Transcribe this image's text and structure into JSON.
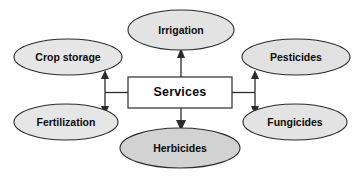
{
  "diagram": {
    "title": "Services",
    "background_color": "#ffffff",
    "center_node": {
      "id": "services",
      "label": "Services",
      "shape": "rectangle",
      "fill": "#ffffff",
      "stroke": "#2b2b2b",
      "x": 128,
      "y": 77,
      "width": 104,
      "height": 31
    },
    "nodes": [
      {
        "id": "crop-storage",
        "label": "Crop storage",
        "shape": "ellipse",
        "fill": "#e6e6e6",
        "stroke": "#2b2b2b",
        "cx": 68,
        "cy": 57,
        "rx": 54,
        "ry": 18
      },
      {
        "id": "irrigation",
        "label": "Irrigation",
        "shape": "ellipse",
        "fill": "#e3e3e3",
        "stroke": "#2b2b2b",
        "cx": 181,
        "cy": 30,
        "rx": 53,
        "ry": 20
      },
      {
        "id": "pesticides",
        "label": "Pesticides",
        "shape": "ellipse",
        "fill": "#e1e1e1",
        "stroke": "#2b2b2b",
        "cx": 296,
        "cy": 57,
        "rx": 54,
        "ry": 18
      },
      {
        "id": "fertilization",
        "label": "Fertilization",
        "shape": "ellipse",
        "fill": "#e6e6e6",
        "stroke": "#2b2b2b",
        "cx": 66,
        "cy": 122,
        "rx": 52,
        "ry": 18
      },
      {
        "id": "herbicides",
        "label": "Herbicides",
        "shape": "ellipse",
        "fill": "#d2d2d2",
        "stroke": "#2b2b2b",
        "cx": 180,
        "cy": 148,
        "rx": 60,
        "ry": 20
      },
      {
        "id": "fungicides",
        "label": "Fungicides",
        "shape": "ellipse",
        "fill": "#e3e3e3",
        "stroke": "#2b2b2b",
        "cx": 295,
        "cy": 122,
        "rx": 52,
        "ry": 18
      }
    ],
    "connectors": [
      {
        "id": "services-to-irrigation",
        "from": "services",
        "to": "irrigation",
        "direction": "up",
        "arrowheads": "single"
      },
      {
        "id": "services-to-herbicides",
        "from": "services",
        "to": "herbicides",
        "direction": "down",
        "arrowheads": "single"
      },
      {
        "id": "services-to-crop-storage-fertilization",
        "from": "services",
        "to": "crop-storage / fertilization",
        "direction": "left",
        "arrowheads": "double"
      },
      {
        "id": "services-to-pesticides-fungicides",
        "from": "services",
        "to": "pesticides / fungicides",
        "direction": "right",
        "arrowheads": "double"
      }
    ]
  }
}
